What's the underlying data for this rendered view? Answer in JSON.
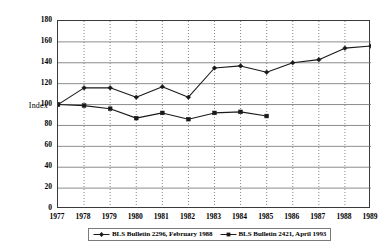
{
  "chart_data": {
    "type": "line",
    "title": "",
    "xlabel": "",
    "ylabel": "Index",
    "x": [
      1977,
      1978,
      1979,
      1980,
      1981,
      1982,
      1983,
      1984,
      1985,
      1986,
      1987,
      1988,
      1989
    ],
    "xtick_labels": [
      "1977",
      "1978",
      "1979",
      "1980",
      "1981",
      "1982",
      "1983",
      "1984",
      "1985",
      "1986",
      "1987",
      "1988",
      "1989"
    ],
    "ytick_labels": [
      "0",
      "20",
      "40",
      "60",
      "80",
      "100",
      "120",
      "140",
      "160",
      "180"
    ],
    "yticks": [
      0,
      20,
      40,
      60,
      80,
      100,
      120,
      140,
      160,
      180
    ],
    "ylim": [
      0,
      180
    ],
    "xlim": [
      1977,
      1989
    ],
    "grid": true,
    "grid_x": true,
    "grid_y": true,
    "legend_position": "bottom",
    "series": [
      {
        "name": "BLS Bulletin 2296, February 1988",
        "marker": "diamond",
        "color": "#1a1a1a",
        "x": [
          1977,
          1978,
          1979,
          1980,
          1981,
          1982,
          1983,
          1984,
          1985,
          1986,
          1987,
          1988,
          1989
        ],
        "values": [
          100,
          116,
          116,
          107,
          117,
          107,
          135,
          137,
          131,
          140,
          143,
          154,
          156
        ]
      },
      {
        "name": "BLS Bulletin 2421, April 1993",
        "marker": "square",
        "color": "#1a1a1a",
        "x": [
          1977,
          1978,
          1979,
          1980,
          1981,
          1982,
          1983,
          1984,
          1985
        ],
        "values": [
          100,
          99,
          96,
          87,
          92,
          86,
          92,
          93,
          89
        ]
      }
    ]
  },
  "legend": {
    "entries": [
      {
        "label": "BLS Bulletin 2296, February 1988"
      },
      {
        "label": "BLS Bulletin 2421, April 1993"
      }
    ]
  },
  "axis": {
    "y_title": "Index"
  }
}
